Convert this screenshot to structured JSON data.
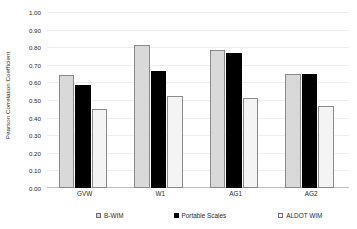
{
  "chart_data": {
    "type": "bar",
    "title": "",
    "xlabel": "",
    "ylabel": "Pearson Correlation Coefficient",
    "categories": [
      "GVW",
      "W1",
      "AG1",
      "AG2"
    ],
    "series": [
      {
        "name": "B-WIM",
        "values": [
          0.64,
          0.81,
          0.785,
          0.645
        ]
      },
      {
        "name": "Portable Scales",
        "values": [
          0.585,
          0.665,
          0.765,
          0.648
        ]
      },
      {
        "name": "ALDOT WIM",
        "values": [
          0.45,
          0.52,
          0.51,
          0.465
        ]
      }
    ],
    "ylim": [
      0.0,
      1.0
    ],
    "ytick_step": 0.1,
    "ytick_labels": [
      "0.00",
      "0.10",
      "0.20",
      "0.30",
      "0.40",
      "0.50",
      "0.60",
      "0.70",
      "0.80",
      "0.90",
      "1.00"
    ],
    "ytick_values": [
      0.0,
      0.1,
      0.2,
      0.3,
      0.4,
      0.5,
      0.6,
      0.7,
      0.8,
      0.9,
      1.0
    ],
    "grid": true,
    "legend_position": "bottom",
    "colors": {
      "series_0_fill": "#d9d9d9",
      "series_0_border": "#8a8a8a",
      "series_1_fill": "#000000",
      "series_1_border": "#000000",
      "series_2_fill": "#f4f4f4",
      "series_2_border": "#8a8a8a",
      "gridline": "#eeeeee",
      "axis": "#bfbfbf",
      "text": "#2b2b2b",
      "background": "#ffffff"
    }
  }
}
